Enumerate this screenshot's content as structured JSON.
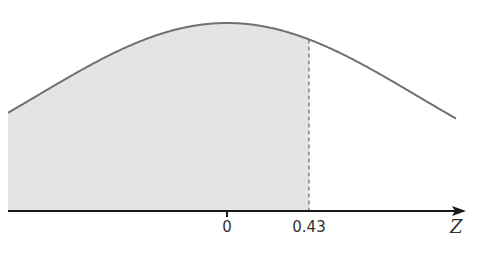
{
  "chart_data": {
    "type": "area",
    "title": "",
    "xlabel": "Z",
    "ylabel": "",
    "distribution": "standard-normal",
    "mean": 0,
    "sd": 1,
    "shaded_region": {
      "from": "-inf",
      "to": 0.43
    },
    "marker": {
      "z": 0.43,
      "style": "dashed"
    },
    "tick_labels": [
      "0",
      "0.43"
    ],
    "tick_values": [
      0,
      0.43
    ],
    "xlim": [
      -3.5,
      3.5
    ],
    "grid": false,
    "legend": null
  },
  "axis": {
    "label": "Z"
  },
  "ticks": [
    {
      "label": "0",
      "z": 0
    },
    {
      "label": "0.43",
      "z": 0.43
    }
  ],
  "colors": {
    "curve": "#707070",
    "fill": "#e4e4e4",
    "axis": "#1a1a1a",
    "dashed": "#666666"
  }
}
